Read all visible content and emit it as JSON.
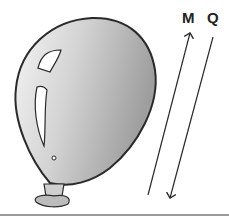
{
  "diagram": {
    "labels": {
      "m": "M",
      "q": "Q"
    },
    "colors": {
      "balloon_light": "#f2f2f2",
      "balloon_dark": "#a8a8a8",
      "outline": "#2a2a2a",
      "rule": "#9a9a9a"
    },
    "elements": [
      {
        "id": "balloon",
        "type": "balloon"
      },
      {
        "id": "line-m",
        "type": "arrow",
        "direction": "up",
        "label": "M"
      },
      {
        "id": "line-q",
        "type": "arrow",
        "direction": "down",
        "label": "Q"
      }
    ]
  }
}
